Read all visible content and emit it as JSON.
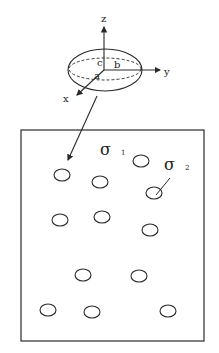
{
  "figure": {
    "ellipsoid": {
      "axis_labels": {
        "x": "x",
        "y": "y",
        "z": "z"
      },
      "semi_axis_labels": {
        "a": "a",
        "b": "b",
        "c": "c"
      }
    },
    "box": {
      "labels": {
        "sigma1": {
          "symbol": "σ",
          "subscript": "1"
        },
        "sigma2": {
          "symbol": "σ",
          "subscript": "2"
        }
      },
      "inclusion_count": 11
    },
    "colors": {
      "line": "#2a2a2a",
      "background": "#ffffff"
    }
  }
}
